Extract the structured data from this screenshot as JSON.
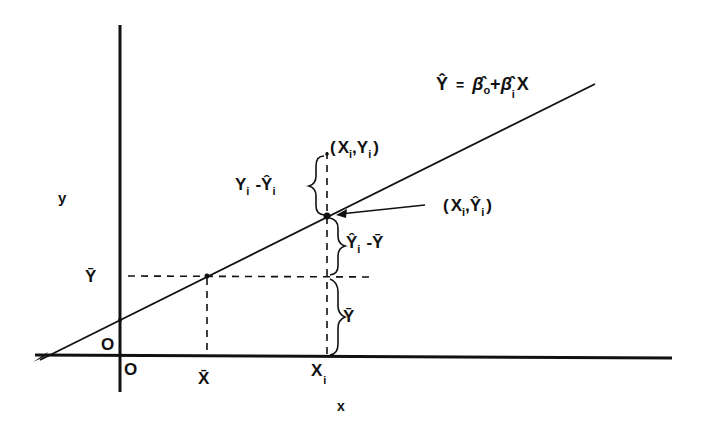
{
  "diagram": {
    "type": "regression-line-decomposition",
    "axes": {
      "x_label": "x",
      "y_label": "y",
      "x_origin_label": "O",
      "y_origin_label": "O"
    },
    "equation": {
      "lhs": "Ŷ",
      "eq": "=",
      "b0": "β̂",
      "b0_sub": "o",
      "plus": "+",
      "b1": "β̂",
      "b1_sub": "i",
      "x": "X"
    },
    "x_ticks": [
      {
        "label": "X̄",
        "sub": ""
      },
      {
        "label": "X",
        "sub": "i"
      }
    ],
    "y_ticks": [
      {
        "label": "Ȳ"
      }
    ],
    "points": {
      "observed": {
        "open": "(",
        "x": "X",
        "x_sub": "i",
        "comma": ",",
        "y": "Y",
        "y_sub": "i",
        "close": ")"
      },
      "fitted": {
        "open": "(",
        "x": "X",
        "x_sub": "i",
        "comma": ",",
        "y": "Ŷ",
        "y_sub": "i",
        "close": ")"
      }
    },
    "braces": {
      "residual": {
        "a": "Y",
        "a_sub": "i",
        "minus": "-",
        "b": "Ŷ",
        "b_sub": "i"
      },
      "explained": {
        "a": "Ŷ",
        "a_sub": "i",
        "minus": "-",
        "b": "Ȳ"
      },
      "mean": {
        "a": "Ȳ"
      }
    },
    "colors": {
      "ink": "#111111",
      "background": "#ffffff"
    }
  }
}
